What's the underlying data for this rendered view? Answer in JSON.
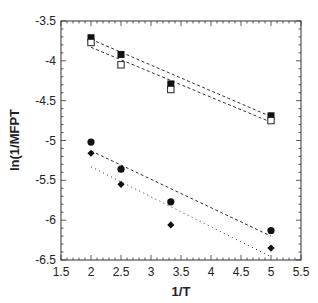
{
  "chart_data": {
    "type": "scatter",
    "title": "",
    "xlabel": "1/T",
    "ylabel": "ln(1/MFPT",
    "xlim": [
      1.5,
      5.5
    ],
    "ylim": [
      -6.5,
      -3.5
    ],
    "x_ticks": [
      "1.5",
      "2",
      "2.5",
      "3",
      "3.5",
      "4",
      "4.5",
      "5",
      "5.5"
    ],
    "y_ticks": [
      "-3.5",
      "-4",
      "-4.5",
      "-5",
      "-5.5",
      "-6",
      "-6.5"
    ],
    "grid": false,
    "legend": null,
    "series": [
      {
        "name": "filled squares",
        "marker": "square-filled",
        "x": [
          2,
          2.5,
          3.33,
          5
        ],
        "y": [
          -3.71,
          -3.92,
          -4.29,
          -4.69
        ],
        "fit": {
          "style": "dashed",
          "x": [
            2,
            5
          ],
          "y": [
            -3.73,
            -4.7
          ]
        }
      },
      {
        "name": "open squares",
        "marker": "square-open",
        "x": [
          2,
          2.5,
          3.33,
          5
        ],
        "y": [
          -3.77,
          -4.05,
          -4.36,
          -4.75
        ],
        "fit": {
          "style": "dashed",
          "x": [
            2,
            5
          ],
          "y": [
            -3.83,
            -4.77
          ]
        }
      },
      {
        "name": "filled circles",
        "marker": "circle-filled",
        "x": [
          2,
          2.5,
          3.33,
          5
        ],
        "y": [
          -5.02,
          -5.36,
          -5.77,
          -6.13
        ],
        "fit": {
          "style": "dashed",
          "x": [
            2,
            5
          ],
          "y": [
            -5.13,
            -6.2
          ]
        }
      },
      {
        "name": "filled diamonds",
        "marker": "diamond-filled",
        "x": [
          2,
          2.5,
          3.33,
          5
        ],
        "y": [
          -5.16,
          -5.55,
          -6.06,
          -6.35
        ],
        "fit": {
          "style": "dotted",
          "x": [
            2,
            5
          ],
          "y": [
            -5.33,
            -6.46
          ]
        }
      }
    ]
  },
  "labels": {
    "xlabel": "1/T",
    "ylabel": "ln(1/MFPT"
  }
}
